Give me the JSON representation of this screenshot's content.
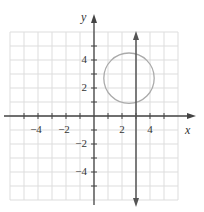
{
  "chart_data": {
    "type": "line",
    "title": "",
    "xlabel": "x",
    "ylabel": "y",
    "xlim": [
      -6,
      6
    ],
    "ylim": [
      -6,
      6
    ],
    "grid": true,
    "x_ticks": [
      -4,
      -2,
      2,
      4
    ],
    "y_ticks": [
      4,
      2,
      -2,
      -4
    ],
    "series": [
      {
        "name": "circle",
        "kind": "circle",
        "center": [
          2.5,
          2.7
        ],
        "radius": 1.8,
        "color": "#aaaaaa"
      },
      {
        "name": "vertical line x = 3",
        "kind": "vertical-line",
        "x": 3,
        "arrows": "both",
        "color": "#555555"
      }
    ]
  },
  "labels": {
    "x_axis": "x",
    "y_axis": "y",
    "x_tick_labels": [
      "−4",
      "−2",
      "2",
      "4"
    ],
    "y_tick_labels": [
      "4",
      "2",
      "−2",
      "−4"
    ]
  },
  "colors": {
    "grid": "#dddddd",
    "axis": "#444444",
    "circle": "#aaaaaa",
    "line": "#555555"
  }
}
